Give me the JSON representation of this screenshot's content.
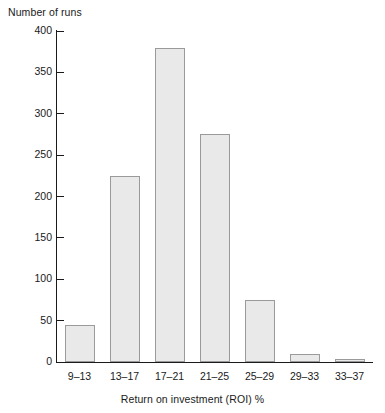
{
  "chart_data": {
    "type": "bar",
    "title": "",
    "xlabel": "Return on investment (ROI) %",
    "ylabel": "Number of runs",
    "categories": [
      "9–13",
      "13–17",
      "17–21",
      "21–25",
      "25–29",
      "29–33",
      "33–37"
    ],
    "values": [
      45,
      225,
      380,
      275,
      75,
      10,
      4
    ],
    "ylim": [
      0,
      400
    ],
    "yticks": [
      0,
      50,
      100,
      150,
      200,
      250,
      300,
      350,
      400
    ],
    "ytick_labels": [
      "0",
      "50",
      "100",
      "150",
      "200",
      "250",
      "300",
      "350",
      "400"
    ],
    "grid": false,
    "legend": null,
    "colors": {
      "bar_fill": "#e9e9e9",
      "bar_border": "#9a9a9a",
      "axis": "#1a1a1a",
      "text": "#1a1a1a",
      "background": "#ffffff"
    }
  }
}
